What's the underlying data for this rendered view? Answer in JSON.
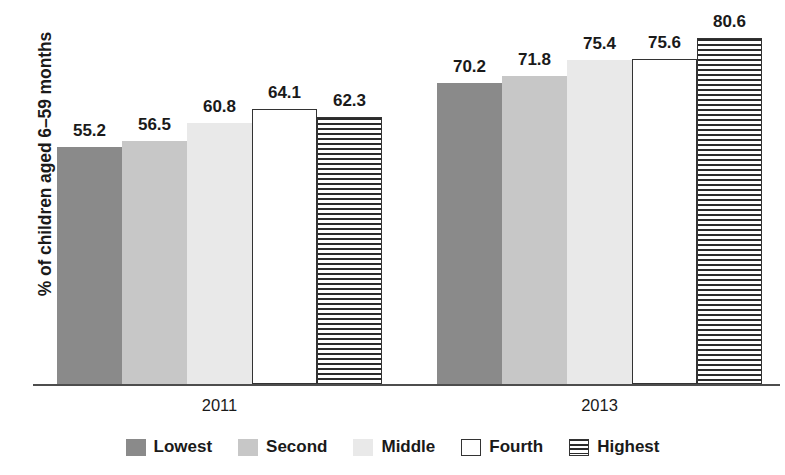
{
  "chart_data": {
    "type": "bar",
    "title": "",
    "subtitle": "",
    "xlabel": "",
    "ylabel": "% of children aged 6–59 months",
    "categories": [
      "2011",
      "2013"
    ],
    "ylim": [
      0,
      80.6
    ],
    "grid": false,
    "legend_position": "bottom",
    "value_labels": true,
    "series": [
      {
        "name": "Lowest",
        "values": [
          55.2,
          70.2
        ],
        "fill": "#8a8a8a",
        "pattern": "solid",
        "swatch_label": "Lowest"
      },
      {
        "name": "Second",
        "values": [
          56.5,
          71.8
        ],
        "fill": "#c7c7c7",
        "pattern": "solid",
        "swatch_label": "Second"
      },
      {
        "name": "Middle",
        "values": [
          60.8,
          75.4
        ],
        "fill": "#e9e9e9",
        "pattern": "solid",
        "swatch_label": "Middle"
      },
      {
        "name": "Fourth",
        "values": [
          64.1,
          75.6
        ],
        "fill": "#ffffff",
        "pattern": "outline",
        "swatch_label": "Fourth"
      },
      {
        "name": "Highest",
        "values": [
          62.3,
          80.6
        ],
        "fill": "#ffffff",
        "pattern": "striped",
        "swatch_label": "Highest"
      }
    ],
    "labels_flat": {
      "g0": [
        "55.2",
        "56.5",
        "60.8",
        "64.1",
        "62.3"
      ],
      "g1": [
        "70.2",
        "71.8",
        "75.4",
        "75.6",
        "80.6"
      ]
    }
  },
  "axis": {
    "y_title": "% of children aged 6–59 months",
    "x_tick_labels": [
      "2011",
      "2013"
    ]
  },
  "legend": {
    "items": [
      {
        "label": "Lowest"
      },
      {
        "label": "Second"
      },
      {
        "label": "Middle"
      },
      {
        "label": "Fourth"
      },
      {
        "label": "Highest"
      }
    ]
  },
  "colors": {
    "lowest": "#8a8a8a",
    "second": "#c7c7c7",
    "middle": "#e9e9e9",
    "fourth": "#ffffff",
    "highest": "#ffffff",
    "axis": "#4d4d4d",
    "text": "#1a1a1a"
  }
}
